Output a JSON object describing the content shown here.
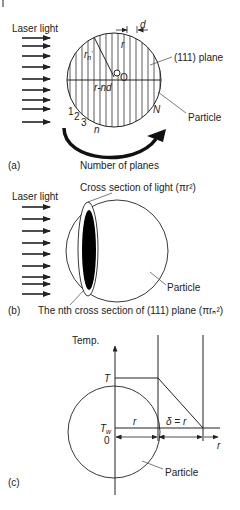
{
  "panel_a": {
    "label": "(a)",
    "laser_label": "Laser light",
    "plane_label": "(111) plane",
    "particle_label": "Particle",
    "caption": "Number of planes",
    "center_label": "O",
    "radius_label": "r",
    "rn_label": "r",
    "rn_sub": "n",
    "rn_prime": "'",
    "offset_label": "r-nd",
    "spacing_label": "d",
    "plane_numbers": [
      "1",
      "2",
      "3"
    ],
    "n_label": "n",
    "N_label": "N"
  },
  "panel_b": {
    "label": "(b)",
    "laser_label": "Laser light",
    "light_cross_section": "Cross section of light (πr²)",
    "plane_cross_section": "The nth cross section of (111) plane (πrₙ²)",
    "particle_label": "Particle"
  },
  "panel_c": {
    "label": "(c)",
    "y_axis_label": "Temp.",
    "T_label": "T",
    "Tw_label": "T",
    "Tw_sub": "w",
    "zero_label": "0",
    "r_label": "r",
    "delta_label": "δ = r",
    "x_axis_label": "r",
    "particle_label": "Particle"
  },
  "colors": {
    "line": "#222222",
    "fill": "#000000",
    "background": "#ffffff"
  }
}
